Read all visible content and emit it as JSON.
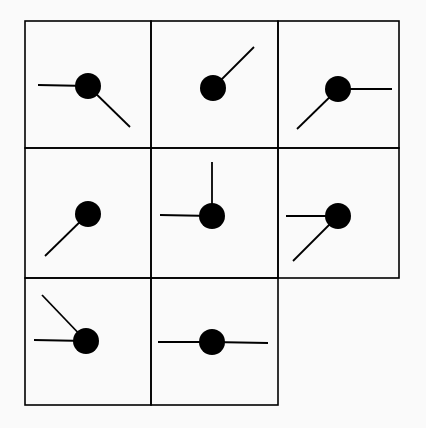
{
  "diagram": {
    "colors": {
      "background": "#fafafa",
      "ink": "#000000"
    },
    "grid": {
      "rows": 3,
      "cols": 3,
      "x": [
        25,
        151,
        278,
        399
      ],
      "y": [
        21,
        148,
        278,
        405
      ],
      "missing_cell": [
        2,
        2
      ]
    },
    "circle_radius": 13,
    "cells": [
      {
        "row": 0,
        "col": 0,
        "circle": [
          88,
          86
        ],
        "lines": [
          [
            38,
            85
          ],
          [
            130,
            127
          ]
        ]
      },
      {
        "row": 0,
        "col": 1,
        "circle": [
          213,
          88
        ],
        "lines": [
          [
            254,
            47
          ]
        ]
      },
      {
        "row": 0,
        "col": 2,
        "circle": [
          338,
          89
        ],
        "lines": [
          [
            392,
            89
          ],
          [
            297,
            129
          ]
        ]
      },
      {
        "row": 1,
        "col": 0,
        "circle": [
          88,
          214
        ],
        "lines": [
          [
            45,
            256
          ]
        ]
      },
      {
        "row": 1,
        "col": 1,
        "circle": [
          212,
          216
        ],
        "lines": [
          [
            212,
            162
          ],
          [
            160,
            215
          ]
        ]
      },
      {
        "row": 1,
        "col": 2,
        "circle": [
          338,
          216
        ],
        "lines": [
          [
            286,
            216
          ],
          [
            293,
            261
          ]
        ]
      },
      {
        "row": 2,
        "col": 0,
        "circle": [
          86,
          341
        ],
        "lines": [
          [
            34,
            340
          ],
          [
            42,
            295
          ]
        ]
      },
      {
        "row": 2,
        "col": 1,
        "circle": [
          212,
          342
        ],
        "lines": [
          [
            158,
            342
          ],
          [
            268,
            343
          ]
        ]
      }
    ]
  }
}
